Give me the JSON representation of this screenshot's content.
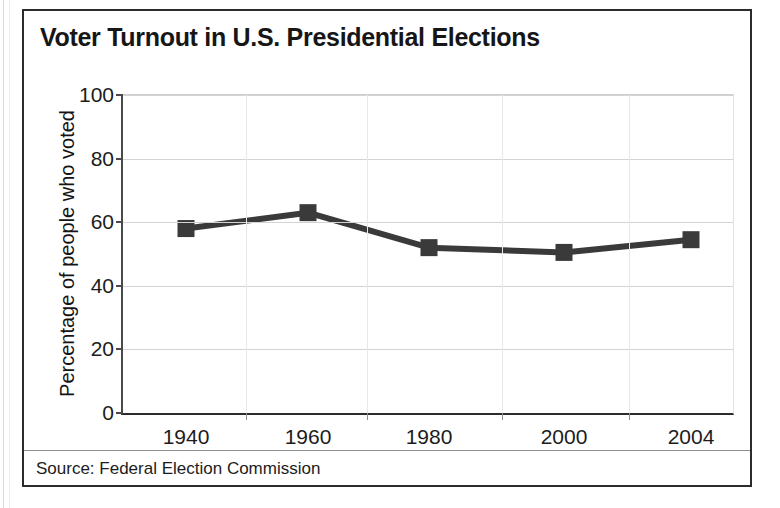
{
  "figure": {
    "title": "Voter Turnout in U.S. Presidential Elections",
    "source_note": "Source: Federal Election Commission",
    "border_color": "#2c2c2c"
  },
  "chart_data": {
    "type": "line",
    "title": "Voter Turnout in U.S. Presidential Elections",
    "xlabel": "",
    "ylabel": "Percentage of people who voted",
    "categories": [
      "1940",
      "1960",
      "1980",
      "2000",
      "2004"
    ],
    "values": [
      58,
      63,
      52,
      50.5,
      54.5
    ],
    "series": [
      {
        "name": "Percentage of people who voted",
        "values": [
          58,
          63,
          52,
          50.5,
          54.5
        ],
        "color": "#3a3a3a",
        "marker": "square"
      }
    ],
    "ylim": [
      0,
      100
    ],
    "yticks": [
      0,
      20,
      40,
      60,
      80,
      100
    ],
    "ytick_labels": [
      "0",
      "20",
      "40",
      "60",
      "80",
      "100"
    ],
    "xtick_labels": [
      "1940",
      "1960",
      "1980",
      "2000",
      "2004"
    ],
    "grid": true,
    "grid_axis": "y",
    "legend": false,
    "legend_position": "none",
    "annotation": "Source: Federal Election Commission"
  }
}
